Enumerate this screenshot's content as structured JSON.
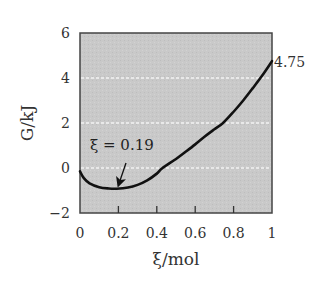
{
  "chart_data": {
    "type": "line",
    "title": "",
    "xlabel": "ξ/mol",
    "ylabel": "G/kJ",
    "xlim": [
      0,
      1
    ],
    "ylim": [
      -2,
      6
    ],
    "x_ticks": [
      0,
      0.2,
      0.4,
      0.6,
      0.8,
      1
    ],
    "x_tick_labels": [
      "0",
      "0.2",
      "0.4",
      "0.6",
      "0.8",
      "1"
    ],
    "y_ticks": [
      -2,
      0,
      2,
      4,
      6
    ],
    "y_tick_labels": [
      "−2",
      "0",
      "2",
      "4",
      "6"
    ],
    "grid": {
      "horizontal": [
        0,
        2,
        4
      ],
      "style": "dashed white"
    },
    "background": "#c8c8c8",
    "series": [
      {
        "name": "G(ξ)",
        "x": [
          0,
          0.02,
          0.05,
          0.1,
          0.15,
          0.19,
          0.25,
          0.3,
          0.35,
          0.4,
          0.43,
          0.5,
          0.55,
          0.6,
          0.65,
          0.7,
          0.745,
          0.8,
          0.85,
          0.9,
          0.95,
          1.0
        ],
        "y": [
          -0.15,
          -0.45,
          -0.68,
          -0.85,
          -0.91,
          -0.92,
          -0.87,
          -0.75,
          -0.55,
          -0.25,
          0.0,
          0.4,
          0.72,
          1.05,
          1.4,
          1.72,
          2.0,
          2.5,
          3.0,
          3.55,
          4.12,
          4.75
        ]
      }
    ],
    "annotations": [
      {
        "text": "ξ = 0.19",
        "x": 0.19,
        "y": -0.92,
        "arrow": true
      },
      {
        "text": "4.75",
        "x": 1.0,
        "y": 4.75,
        "arrow": false
      }
    ]
  },
  "labels": {
    "xlabel": "ξ/mol",
    "ylabel": "G/kJ",
    "min_annotation": "ξ = 0.19",
    "end_value": "4.75",
    "xticks": [
      "0",
      "0.2",
      "0.4",
      "0.6",
      "0.8",
      "1"
    ],
    "yticks": [
      "6",
      "4",
      "2",
      "0",
      "−2"
    ]
  }
}
